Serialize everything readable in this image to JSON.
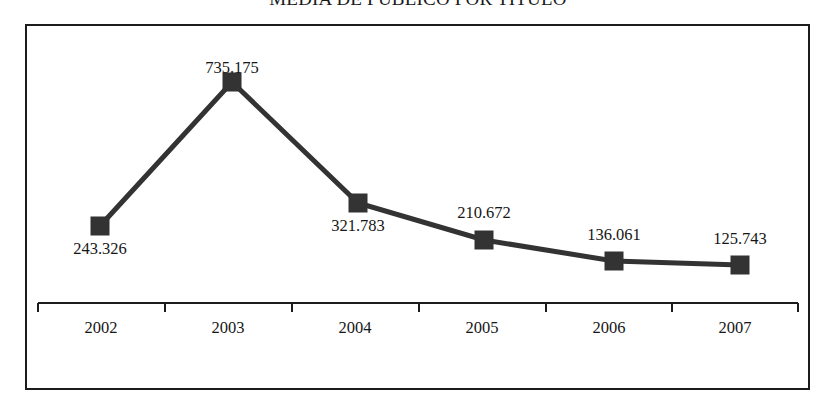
{
  "chart_data": {
    "type": "line",
    "title": "MEDIA DE PÚBLICO POR TÍTULO",
    "xlabel": "",
    "ylabel": "",
    "grid": false,
    "legend": "none",
    "categories": [
      "2002",
      "2003",
      "2004",
      "2005",
      "2006",
      "2007"
    ],
    "values": [
      243326,
      735175,
      321783,
      210672,
      136061,
      125743
    ],
    "value_labels": [
      "243.326",
      "735.175",
      "321.783",
      "210.672",
      "136.061",
      "125.743"
    ],
    "series": [
      {
        "name": "Media de público por título",
        "values": [
          243326,
          735175,
          321783,
          210672,
          136061,
          125743
        ],
        "color": "#333333",
        "marker": "square",
        "line_width": 5
      }
    ],
    "ylim": [
      0,
      800000
    ],
    "axis_line_color": "#1c1c1c",
    "frame_color": "#1c1c1c",
    "background": "#ffffff"
  },
  "points": [
    {
      "category": "2002",
      "label": "243.326",
      "x": 100,
      "y": 226,
      "label_x": 100,
      "label_y": 239,
      "label_anchor": "below"
    },
    {
      "category": "2003",
      "label": "735.175",
      "x": 232,
      "y": 82,
      "label_x": 232,
      "label_y": 58,
      "label_anchor": "above"
    },
    {
      "category": "2004",
      "label": "321.783",
      "x": 358,
      "y": 203,
      "label_x": 358,
      "label_y": 216,
      "label_anchor": "below"
    },
    {
      "category": "2005",
      "label": "210.672",
      "x": 484,
      "y": 240,
      "label_x": 484,
      "label_y": 203,
      "label_anchor": "above"
    },
    {
      "category": "2006",
      "label": "136.061",
      "x": 614,
      "y": 261,
      "label_x": 614,
      "label_y": 225,
      "label_anchor": "above"
    },
    {
      "category": "2007",
      "label": "125.743",
      "x": 740,
      "y": 265,
      "label_x": 740,
      "label_y": 229,
      "label_anchor": "above"
    }
  ],
  "axis": {
    "y": 303,
    "x_start": 38,
    "x_end": 798,
    "tick_height": 9,
    "ticks": [
      38,
      165,
      292,
      419,
      546,
      672,
      798
    ],
    "labels": [
      {
        "text": "2002",
        "x": 101
      },
      {
        "text": "2003",
        "x": 228
      },
      {
        "text": "2004",
        "x": 355
      },
      {
        "text": "2005",
        "x": 482
      },
      {
        "text": "2006",
        "x": 609
      },
      {
        "text": "2007",
        "x": 735
      }
    ]
  }
}
